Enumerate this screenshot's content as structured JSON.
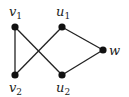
{
  "graph": {
    "nodes": [
      {
        "id": "v1",
        "base": "v",
        "sub": "1",
        "x": 15,
        "y": 27,
        "lx": 9,
        "ly": 16
      },
      {
        "id": "u1",
        "base": "u",
        "sub": "1",
        "x": 62,
        "y": 27,
        "lx": 56,
        "ly": 16
      },
      {
        "id": "w",
        "base": "w",
        "sub": "",
        "x": 103,
        "y": 50,
        "lx": 109,
        "ly": 55
      },
      {
        "id": "v2",
        "base": "v",
        "sub": "2",
        "x": 15,
        "y": 75,
        "lx": 9,
        "ly": 92
      },
      {
        "id": "u2",
        "base": "u",
        "sub": "2",
        "x": 62,
        "y": 75,
        "lx": 56,
        "ly": 92
      }
    ],
    "edges": [
      [
        "v1",
        "v2"
      ],
      [
        "v1",
        "u2"
      ],
      [
        "v2",
        "u1"
      ],
      [
        "u1",
        "w"
      ],
      [
        "u2",
        "w"
      ]
    ],
    "node_color": "#111111",
    "edge_color": "#222222"
  }
}
